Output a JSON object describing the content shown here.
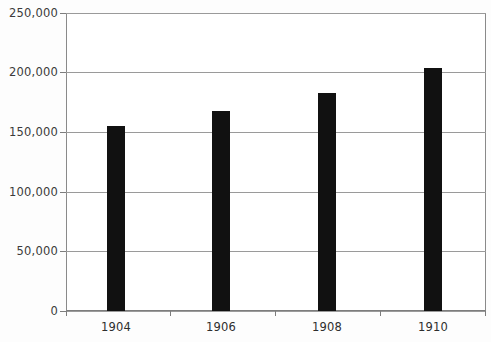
{
  "chart_data": {
    "type": "bar",
    "title": "",
    "subtitle": "",
    "xlabel": "",
    "ylabel": "",
    "categories": [
      "1904",
      "1906",
      "1908",
      "1910"
    ],
    "values": [
      155000,
      168000,
      183000,
      204000
    ],
    "series": [
      {
        "name": "",
        "values": [
          155000,
          168000,
          183000,
          204000
        ]
      }
    ],
    "ylim": [
      0,
      250000
    ],
    "ytick_values": [
      0,
      50000,
      100000,
      150000,
      200000,
      250000
    ],
    "ytick_labels": [
      "0",
      "50,000",
      "100,000",
      "150,000",
      "200,000",
      "250,000"
    ],
    "xtick_labels": [
      "1904",
      "1906",
      "1908",
      "1910"
    ],
    "grid": "horizontal",
    "legend": "none",
    "bar_color": "#111111",
    "axis_color": "#8a8a8a",
    "grid_color": "#9a9a9a",
    "background_color": "#ffffff",
    "annotations": []
  },
  "axes": {
    "y": {
      "labels": [
        "250,000",
        "200,000",
        "150,000",
        "100,000",
        "50,000",
        "0"
      ]
    },
    "x": {
      "labels": [
        "1904",
        "1906",
        "1908",
        "1910"
      ]
    }
  }
}
